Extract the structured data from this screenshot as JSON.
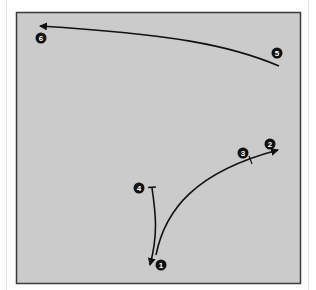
{
  "colors": {
    "panel_fill": "#cbcbcb",
    "panel_border": "#3a3a3a",
    "stroke": "#111111",
    "marker_fill": "#111111",
    "marker_text": "#ffffff",
    "page_background": "#ffffff"
  },
  "markers": [
    {
      "id": "1",
      "label": "1",
      "x": 161,
      "y": 265
    },
    {
      "id": "2",
      "label": "2",
      "x": 270,
      "y": 144
    },
    {
      "id": "3",
      "label": "3",
      "x": 243,
      "y": 153
    },
    {
      "id": "4",
      "label": "4",
      "x": 139,
      "y": 188
    },
    {
      "id": "5",
      "label": "5",
      "x": 277,
      "y": 53
    },
    {
      "id": "6",
      "label": "6",
      "x": 41,
      "y": 38
    }
  ],
  "paths": [
    {
      "name": "path-5-to-6",
      "from": "5",
      "to": "6",
      "description": "long arrow from right marker 5 sweeping left to marker 6"
    },
    {
      "name": "path-1-to-2",
      "from": "1",
      "to": "2",
      "via": "3",
      "description": "curved arrow from marker 1 up and right to marker 2, tick at 3"
    },
    {
      "name": "path-4-to-1",
      "from": "4",
      "to": "1",
      "description": "line from T-end at marker 4 down to arrowhead at marker 1"
    }
  ]
}
